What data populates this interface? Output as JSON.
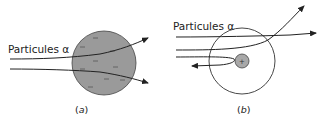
{
  "panel_a": {
    "label": "Particules α",
    "caption_open": "(",
    "caption_letter": "a",
    "caption_close": ")",
    "model": "Thomson plum-pudding atom",
    "sphere_fill": "#9a9a9a",
    "charge_symbol": "−"
  },
  "panel_b": {
    "label": "Particules α",
    "caption_open": "(",
    "caption_letter": "b",
    "caption_close": ")",
    "model": "Rutherford nuclear atom",
    "nucleus_fill": "#a8a8a8",
    "nucleus_symbol": "+"
  }
}
